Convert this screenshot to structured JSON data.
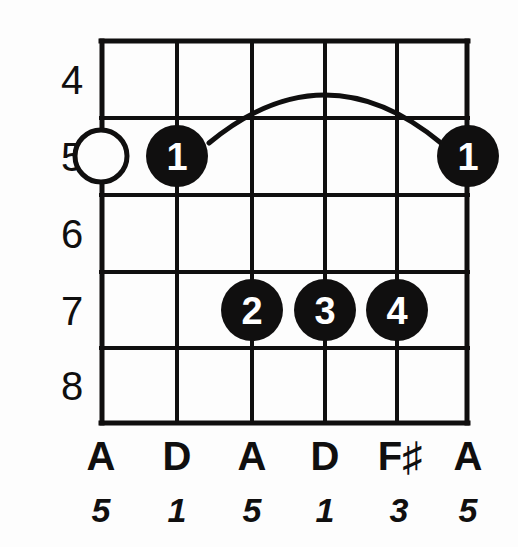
{
  "diagram": {
    "type": "guitar-chord-diagram",
    "title": "",
    "colors": {
      "ink": "#100f0f",
      "background": "#fdfdfd",
      "dot_fill": "#100f0f",
      "dot_text": "#ffffff"
    },
    "fret_numbers": [
      "4",
      "5",
      "6",
      "7",
      "8"
    ],
    "first_fret": 4,
    "last_fret": 8,
    "string_count": 6,
    "note_names": [
      "A",
      "D",
      "A",
      "D",
      "F♯",
      "A"
    ],
    "intervals": [
      "5",
      "1",
      "5",
      "1",
      "3",
      "5"
    ],
    "markers": [
      {
        "string": 1,
        "fret": 5,
        "finger": "",
        "style": "open"
      },
      {
        "string": 2,
        "fret": 5,
        "finger": "1",
        "style": "filled"
      },
      {
        "string": 3,
        "fret": 7,
        "finger": "2",
        "style": "filled"
      },
      {
        "string": 4,
        "fret": 7,
        "finger": "3",
        "style": "filled"
      },
      {
        "string": 5,
        "fret": 7,
        "finger": "4",
        "style": "filled"
      },
      {
        "string": 6,
        "fret": 5,
        "finger": "1",
        "style": "filled"
      }
    ],
    "barre": {
      "present": true,
      "finger": "1",
      "fret": 5,
      "from_string": 2,
      "to_string": 6,
      "label": "barre-arc"
    },
    "finger_labels": {
      "f1a": "1",
      "f1b": "1",
      "f2": "2",
      "f3": "3",
      "f4": "4"
    },
    "fret_label_4": "4",
    "fret_label_5": "5",
    "fret_label_6": "6",
    "fret_label_7": "7",
    "fret_label_8": "8",
    "note_1": "A",
    "note_2": "D",
    "note_3": "A",
    "note_4": "D",
    "note_5": "F♯",
    "note_6": "A",
    "interval_1": "5",
    "interval_2": "1",
    "interval_3": "5",
    "interval_4": "1",
    "interval_5": "3",
    "interval_6": "5"
  }
}
